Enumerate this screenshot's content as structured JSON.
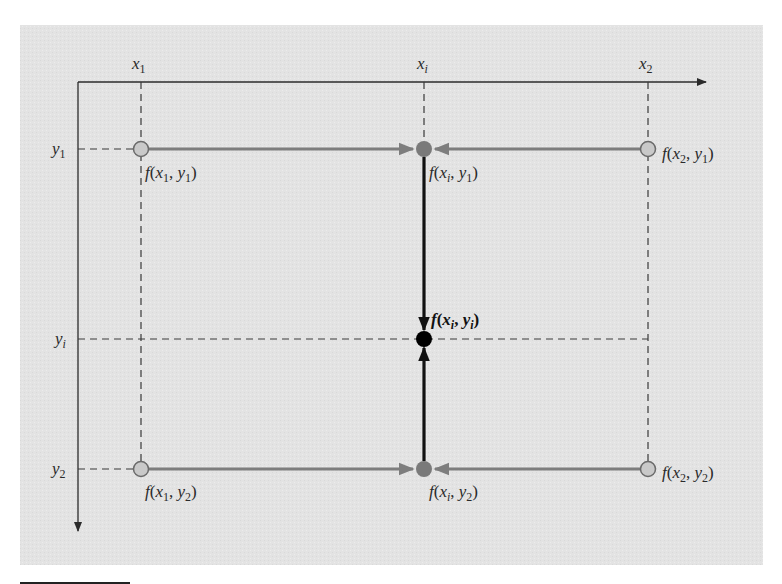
{
  "diagram": {
    "colors": {
      "panel": "#e3e3e3",
      "axis": "#2b2b2b",
      "dashed": "#3a3a3a",
      "gray_arrow": "#7d7d7d",
      "black_arrow": "#111111",
      "open_node_fill": "#c9c9c9",
      "open_node_stroke": "#6a6a6a",
      "gray_node": "#7a7a7a",
      "black_node": "#000000"
    },
    "axis_labels": {
      "x1": "x",
      "x1_sub": "1",
      "xi": "x",
      "xi_sub": "i",
      "x2": "x",
      "x2_sub": "2",
      "y1": "y",
      "y1_sub": "1",
      "yi": "y",
      "yi_sub": "i",
      "y2": "y",
      "y2_sub": "2"
    },
    "nodes": [
      {
        "id": "f_x1_y1",
        "label": "f(x1, y1)",
        "type": "known"
      },
      {
        "id": "f_xi_y1",
        "label": "f(xi, y1)",
        "type": "intermediate"
      },
      {
        "id": "f_x2_y1",
        "label": "f(x2, y1)",
        "type": "known"
      },
      {
        "id": "f_xi_yi",
        "label": "f(xi, yi)",
        "type": "result"
      },
      {
        "id": "f_x1_y2",
        "label": "f(x1, y2)",
        "type": "known"
      },
      {
        "id": "f_xi_y2",
        "label": "f(xi, y2)",
        "type": "intermediate"
      },
      {
        "id": "f_x2_y2",
        "label": "f(x2, y2)",
        "type": "known"
      }
    ],
    "edges": [
      {
        "from": "f_x1_y1",
        "to": "f_xi_y1",
        "color": "gray"
      },
      {
        "from": "f_x2_y1",
        "to": "f_xi_y1",
        "color": "gray"
      },
      {
        "from": "f_x1_y2",
        "to": "f_xi_y2",
        "color": "gray"
      },
      {
        "from": "f_x2_y2",
        "to": "f_xi_y2",
        "color": "gray"
      },
      {
        "from": "f_xi_y1",
        "to": "f_xi_yi",
        "color": "black"
      },
      {
        "from": "f_xi_y2",
        "to": "f_xi_yi",
        "color": "black"
      }
    ]
  }
}
